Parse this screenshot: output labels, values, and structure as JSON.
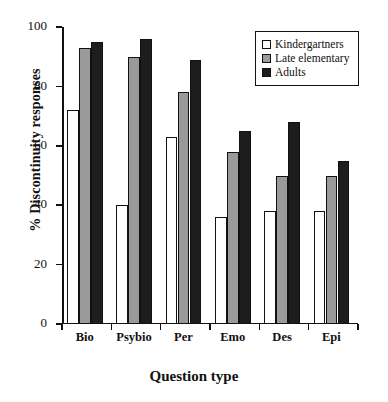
{
  "chart_data": {
    "type": "bar",
    "title": "",
    "xlabel": "Question type",
    "ylabel": "% Discontinuity responses",
    "categories": [
      "Bio",
      "Psybio",
      "Per",
      "Emo",
      "Des",
      "Epi"
    ],
    "series": [
      {
        "name": "Kindergartners",
        "color": "#ffffff",
        "values": [
          72,
          40,
          63,
          36,
          38,
          38
        ]
      },
      {
        "name": "Late elementary",
        "color": "#9a9a9a",
        "values": [
          93,
          90,
          78,
          58,
          50,
          50
        ]
      },
      {
        "name": "Adults",
        "color": "#1d1d1d",
        "values": [
          95,
          96,
          89,
          65,
          68,
          55
        ]
      }
    ],
    "ylim": [
      0,
      100
    ],
    "yticks": [
      0,
      20,
      40,
      60,
      80,
      100
    ],
    "yticklabels": [
      "0",
      "20",
      "40",
      "60",
      "80",
      "100"
    ],
    "grid": false,
    "legend_position": "top-right"
  }
}
